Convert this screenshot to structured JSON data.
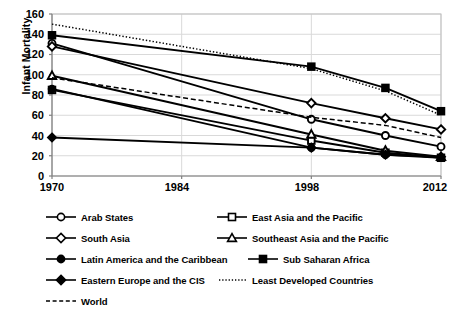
{
  "chart_data": {
    "type": "line",
    "title": "",
    "xlabel": "",
    "ylabel": "Infant Mortality",
    "xlim": [
      1970,
      2012
    ],
    "ylim": [
      0,
      160
    ],
    "ytick_values": [
      0,
      20,
      40,
      60,
      80,
      100,
      120,
      140,
      160
    ],
    "xtick_values": [
      1970,
      1984,
      1998,
      2012
    ],
    "grid": "horizontal-and-vertical-light",
    "legend_position": "bottom",
    "x": [
      1970,
      1998,
      2006,
      2012
    ],
    "series": [
      {
        "name": "Arab States",
        "marker": "open-circle",
        "line_style": "solid",
        "color": "#000000",
        "values": [
          131,
          56,
          40,
          29
        ]
      },
      {
        "name": "East Asia and the Pacific",
        "marker": "open-square",
        "line_style": "solid",
        "color": "#000000",
        "values": [
          85,
          35,
          23,
          18
        ]
      },
      {
        "name": "South Asia",
        "marker": "open-diamond",
        "line_style": "solid",
        "color": "#000000",
        "values": [
          128,
          72,
          57,
          46
        ]
      },
      {
        "name": "Southeast Asia and the Pacific",
        "marker": "open-triangle",
        "line_style": "solid",
        "color": "#000000",
        "values": [
          99,
          41,
          25,
          19
        ]
      },
      {
        "name": "Latin America and the Caribbean",
        "marker": "filled-circle",
        "line_style": "solid",
        "color": "#000000",
        "values": [
          86,
          28,
          21,
          18
        ]
      },
      {
        "name": "Sub Saharan Africa",
        "marker": "filled-square",
        "line_style": "solid",
        "color": "#000000",
        "values": [
          139,
          108,
          87,
          64
        ]
      },
      {
        "name": "Eastern Europe and the CIS",
        "marker": "filled-diamond",
        "line_style": "solid",
        "color": "#000000",
        "values": [
          38,
          28,
          21,
          19
        ]
      },
      {
        "name": "Least Developed Countries",
        "marker": "none",
        "line_style": "dotted",
        "color": "#000000",
        "values": [
          150,
          106,
          84,
          60
        ]
      },
      {
        "name": "World",
        "marker": "none",
        "line_style": "dashed",
        "color": "#000000",
        "values": [
          97,
          58,
          50,
          38
        ]
      }
    ]
  },
  "axis": {
    "y_title": "Infant Mortality",
    "y_ticks": [
      "160",
      "140",
      "120",
      "100",
      "80",
      "60",
      "40",
      "20",
      "0"
    ],
    "x_ticks": [
      "1970",
      "1984",
      "1998",
      "2012"
    ]
  },
  "legend": {
    "items": [
      {
        "label": "Arab States"
      },
      {
        "label": "East Asia and the Pacific"
      },
      {
        "label": "South Asia"
      },
      {
        "label": "Southeast Asia and the Pacific"
      },
      {
        "label": "Latin America and the Caribbean"
      },
      {
        "label": "Sub Saharan Africa"
      },
      {
        "label": "Eastern Europe and the CIS"
      },
      {
        "label": "Least Developed Countries"
      },
      {
        "label": "World"
      }
    ]
  }
}
